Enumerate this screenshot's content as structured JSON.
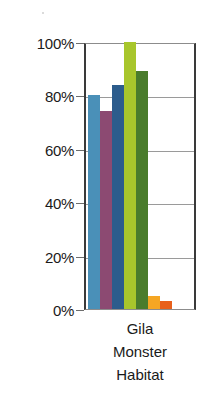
{
  "chart_data": {
    "type": "bar",
    "title": "",
    "xlabel": "Gila Monster Habitat",
    "xlabel_lines": [
      "Gila",
      "Monster",
      "Habitat"
    ],
    "ylabel": "",
    "ylim": [
      0,
      100
    ],
    "yticks": [
      0,
      20,
      40,
      60,
      80,
      100
    ],
    "ytick_labels": [
      "0%",
      "20%",
      "40%",
      "60%",
      "80%",
      "100%"
    ],
    "grid": true,
    "legend": "none",
    "categories": [
      "Gila Monster Habitat"
    ],
    "series": [
      {
        "name": "Series 1",
        "color": "#4a90b8",
        "values": [
          80
        ]
      },
      {
        "name": "Series 2",
        "color": "#8c4a72",
        "values": [
          74
        ]
      },
      {
        "name": "Series 3",
        "color": "#2c5c8c",
        "values": [
          84
        ]
      },
      {
        "name": "Series 4",
        "color": "#a8c62c",
        "values": [
          100
        ]
      },
      {
        "name": "Series 5",
        "color": "#4a7c2c",
        "values": [
          89
        ]
      },
      {
        "name": "Series 6",
        "color": "#f5a623",
        "values": [
          5
        ]
      },
      {
        "name": "Series 7",
        "color": "#e8601c",
        "values": [
          3
        ]
      }
    ]
  },
  "axis": {
    "ticks": [
      {
        "label": "100%",
        "value": 100
      },
      {
        "label": "80%",
        "value": 80
      },
      {
        "label": "60%",
        "value": 60
      },
      {
        "label": "40%",
        "value": 40
      },
      {
        "label": "20%",
        "value": 20
      },
      {
        "label": "0%",
        "value": 0
      }
    ]
  },
  "caption": {
    "line1": "Gila",
    "line2": "Monster",
    "line3": "Habitat"
  }
}
